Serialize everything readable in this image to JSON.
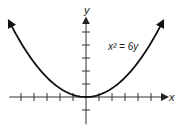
{
  "chart_data": {
    "type": "line",
    "title": "",
    "xlabel": "x",
    "ylabel": "y",
    "equation_label": "x² = 6y",
    "equation": {
      "a": 6
    },
    "xlim": [
      -5.9,
      6.0
    ],
    "ylim": [
      -2.1,
      6.2
    ],
    "x_ticks": [
      -5,
      -4,
      -3,
      -2,
      -1,
      1,
      2,
      3,
      4,
      5
    ],
    "y_ticks": [
      -1,
      1,
      2,
      3,
      4,
      5
    ],
    "curve_x_range": [
      -5.9,
      5.9
    ],
    "series": [
      {
        "name": "x² = 6y",
        "function": "y = x^2 / 6",
        "arrows_at_ends": true
      }
    ],
    "grid": false,
    "legend": "none",
    "colors": {
      "axis": "#333333",
      "curve": "#111111"
    }
  }
}
